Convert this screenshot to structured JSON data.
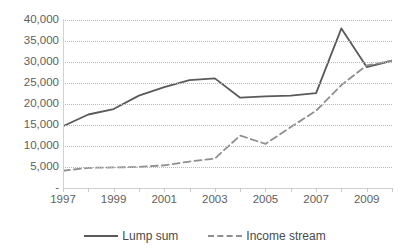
{
  "chart_data": {
    "type": "line",
    "title": "",
    "xlabel": "",
    "ylabel": "",
    "grid": true,
    "legend_position": "bottom",
    "x": [
      1997,
      1998,
      1999,
      2000,
      2001,
      2002,
      2003,
      2004,
      2005,
      2006,
      2007,
      2008,
      2009,
      2010
    ],
    "xlim": [
      1997,
      2010
    ],
    "ylim": [
      0,
      40000
    ],
    "ytick_values": [
      0,
      5000,
      10000,
      15000,
      20000,
      25000,
      30000,
      35000,
      40000
    ],
    "ytick_labels": [
      "-",
      "5,000",
      "10,000",
      "15,000",
      "20,000",
      "25,000",
      "30,000",
      "35,000",
      "40,000"
    ],
    "xtick_values": [
      1997,
      1999,
      2001,
      2003,
      2005,
      2007,
      2009
    ],
    "xtick_labels": [
      "1997",
      "1999",
      "2001",
      "2003",
      "2005",
      "2007",
      "2009"
    ],
    "series": [
      {
        "name": "Lump sum",
        "style": "solid",
        "color": "#5a5a5a",
        "values": [
          14700,
          17500,
          18800,
          22000,
          24000,
          25700,
          26100,
          21500,
          21800,
          22000,
          22600,
          38000,
          28800,
          30300
        ]
      },
      {
        "name": "Income stream",
        "style": "dashed",
        "color": "#8f8f8f",
        "values": [
          4100,
          4800,
          4900,
          5000,
          5400,
          6300,
          7000,
          12500,
          10500,
          14500,
          18400,
          24500,
          29200,
          30300
        ]
      }
    ]
  },
  "legend": {
    "items": [
      {
        "label": "Lump sum",
        "style": "solid",
        "color": "#5a5a5a"
      },
      {
        "label": "Income stream",
        "style": "dashed",
        "color": "#8f8f8f"
      }
    ]
  }
}
